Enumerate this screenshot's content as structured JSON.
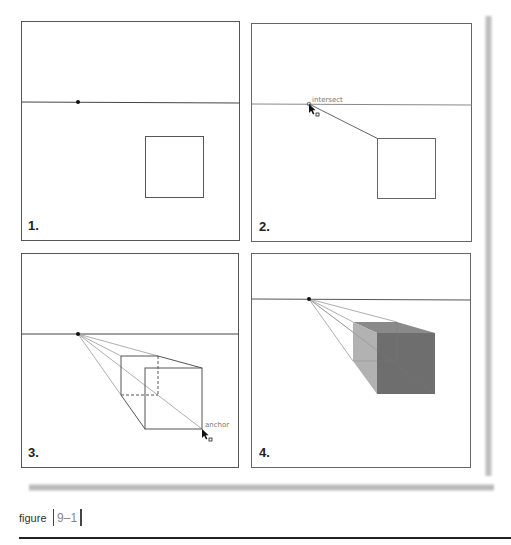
{
  "figure": {
    "caption_word": "figure",
    "caption_number": "9–1"
  },
  "panels": [
    {
      "label": "1.",
      "step": "Horizon line with vanishing point and a square"
    },
    {
      "label": "2.",
      "step": "Line drawn from square corner to vanishing point",
      "annotation": "intersect"
    },
    {
      "label": "3.",
      "step": "Wireframe box extruded toward vanishing point",
      "annotation": "anchor"
    },
    {
      "label": "4.",
      "step": "Shaded solid box in one-point perspective"
    }
  ],
  "colors": {
    "frame": "#555555",
    "horizon": "#444444",
    "guide": "#999999",
    "front_face": "#6e6e6e",
    "side_face": "#b2b2b2",
    "top_face": "#8a8a8a"
  },
  "cursor_glyph": "cursor-arrow-icon"
}
